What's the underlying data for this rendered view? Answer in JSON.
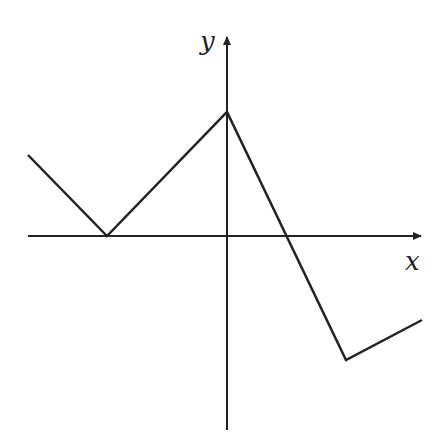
{
  "diagram": {
    "type": "piecewise-linear-graph",
    "axes": {
      "x_label": "x",
      "y_label": "y"
    },
    "graph_points_px": [
      [
        28,
        155
      ],
      [
        107,
        236
      ],
      [
        227,
        112
      ],
      [
        346,
        360
      ],
      [
        422,
        320
      ]
    ],
    "colors": {
      "line": "#222222",
      "background": "#ffffff"
    }
  }
}
